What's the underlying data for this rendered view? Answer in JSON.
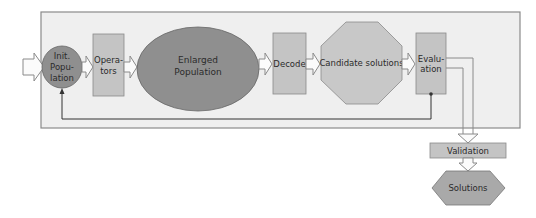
{
  "diagram": {
    "type": "flowchart",
    "colors": {
      "container_fill": "#efefef",
      "container_stroke": "#8a8a8a",
      "ellipse_fill": "#8f8f8f",
      "box_fill": "#c4c4c4",
      "octagon_fill": "#c8c8c8",
      "arrow_fill": "#fbfbfb",
      "arrow_stroke": "#8a8a8a",
      "line": "#333333"
    },
    "nodes": {
      "init_population": {
        "lines": [
          "Init.",
          "Popu-",
          "lation"
        ],
        "shape": "circle"
      },
      "operators": {
        "lines": [
          "Opera-",
          "tors"
        ],
        "shape": "rectangle"
      },
      "enlarged_population": {
        "lines": [
          "Enlarged",
          "Population"
        ],
        "shape": "ellipse"
      },
      "decode": {
        "label": "Decode",
        "shape": "rectangle"
      },
      "candidate_solutions": {
        "label": "Candidate solutions",
        "shape": "octagon"
      },
      "evaluation": {
        "lines": [
          "Evalu-",
          "ation"
        ],
        "shape": "rectangle"
      },
      "validation": {
        "label": "Validation",
        "shape": "rectangle"
      },
      "solutions": {
        "label": "Solutions",
        "shape": "hexagon"
      }
    },
    "edges": [
      {
        "from": "input",
        "to": "init_population"
      },
      {
        "from": "init_population",
        "to": "operators"
      },
      {
        "from": "operators",
        "to": "enlarged_population"
      },
      {
        "from": "enlarged_population",
        "to": "decode"
      },
      {
        "from": "decode",
        "to": "candidate_solutions"
      },
      {
        "from": "candidate_solutions",
        "to": "evaluation"
      },
      {
        "from": "evaluation",
        "to": "init_population",
        "style": "feedback-line"
      },
      {
        "from": "evaluation",
        "to": "validation"
      },
      {
        "from": "validation",
        "to": "solutions"
      }
    ]
  }
}
